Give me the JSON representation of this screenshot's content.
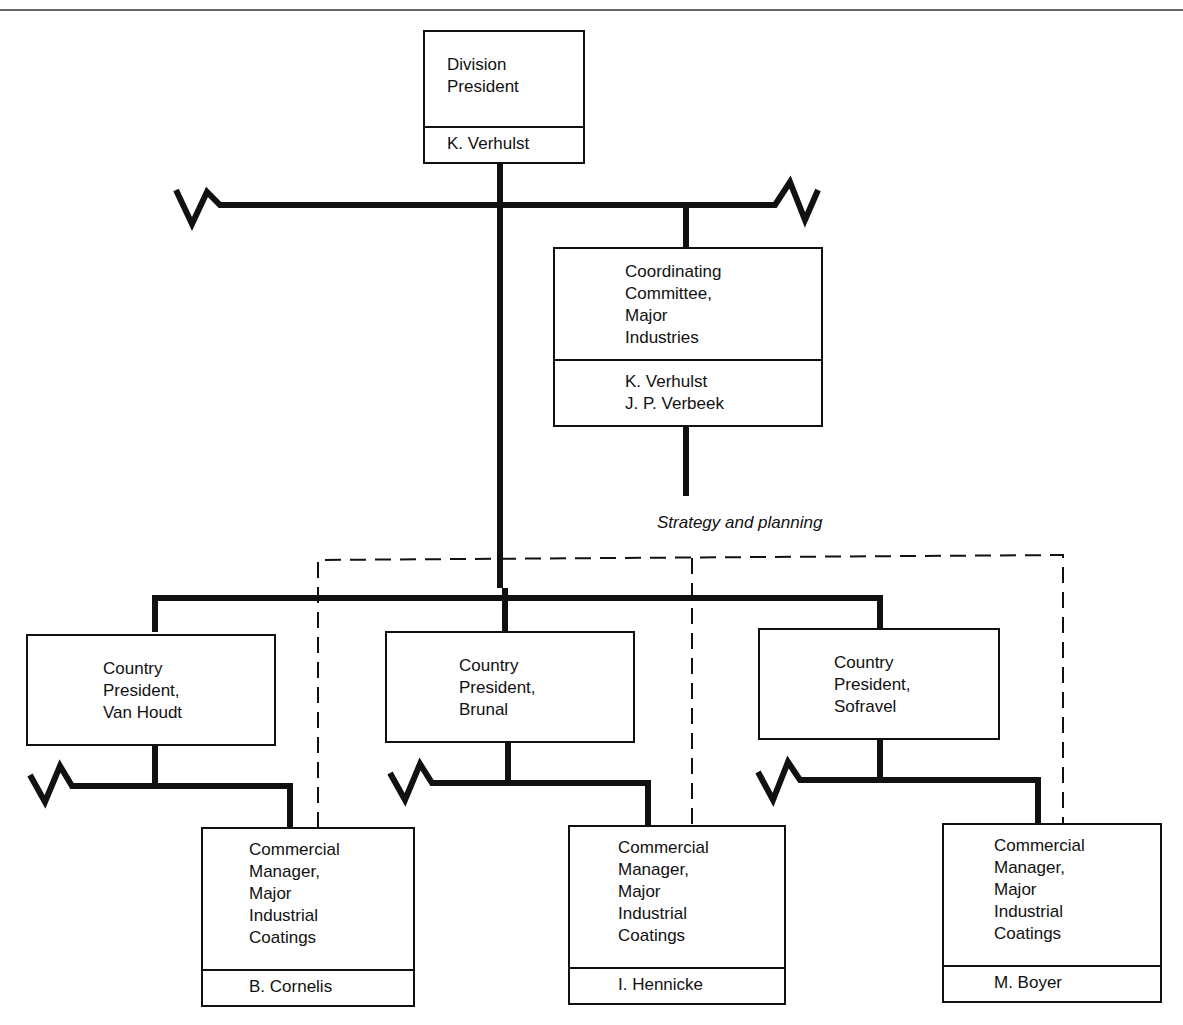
{
  "chart": {
    "division_president": {
      "title_lines": [
        "Division",
        "President"
      ],
      "name_lines": [
        "K. Verhulst"
      ]
    },
    "coordinating_committee": {
      "title_lines": [
        "Coordinating",
        "Committee,",
        "Major",
        "Industries"
      ],
      "name_lines": [
        "K. Verhulst",
        "J. P. Verbeek"
      ]
    },
    "caption": "Strategy and planning",
    "country_presidents": [
      {
        "title_lines": [
          "Country",
          "President,",
          "Van Houdt"
        ]
      },
      {
        "title_lines": [
          "Country",
          "President,",
          "Brunal"
        ]
      },
      {
        "title_lines": [
          "Country",
          "President,",
          "Sofravel"
        ]
      }
    ],
    "commercial_managers": [
      {
        "title_lines": [
          "Commercial",
          "Manager,",
          "Major",
          "Industrial",
          "Coatings"
        ],
        "name_lines": [
          "B. Cornelis"
        ]
      },
      {
        "title_lines": [
          "Commercial",
          "Manager,",
          "Major",
          "Industrial",
          "Coatings"
        ],
        "name_lines": [
          "I. Hennicke"
        ]
      },
      {
        "title_lines": [
          "Commercial",
          "Manager,",
          "Major",
          "Industrial",
          "Coatings"
        ],
        "name_lines": [
          "M. Boyer"
        ]
      }
    ]
  },
  "colors": {
    "ink": "#111111",
    "background": "#ffffff"
  }
}
